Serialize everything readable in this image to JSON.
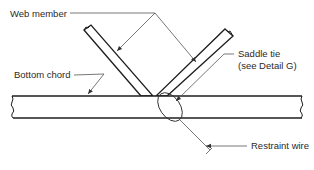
{
  "diagram": {
    "type": "truss-connection-detail",
    "labels": {
      "web_member": "Web member",
      "bottom_chord": "Bottom chord",
      "saddle_tie_line1": "Saddle tie",
      "saddle_tie_line2": "(see Detail G)",
      "restraint_wire": "Restraint wire"
    },
    "components": [
      {
        "id": "web-member-left",
        "name": "Web member (left diagonal)"
      },
      {
        "id": "web-member-right",
        "name": "Web member (right diagonal)"
      },
      {
        "id": "bottom-chord",
        "name": "Bottom chord"
      },
      {
        "id": "saddle-tie",
        "name": "Saddle tie"
      },
      {
        "id": "restraint-wire",
        "name": "Restraint wire"
      }
    ],
    "colors": {
      "line": "#1e1e1e",
      "leader": "#555555",
      "background": "#ffffff"
    }
  }
}
